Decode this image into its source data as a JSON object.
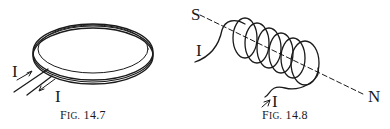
{
  "figures": [
    {
      "id": "fig-14-7",
      "caption_prefix": "F",
      "caption_smallcaps": "IG.",
      "caption_number": "14.7",
      "labels": {
        "current_in": "I",
        "current_out": "I"
      },
      "description": "Flat circular coil of several turns with two leads carrying current I in and out"
    },
    {
      "id": "fig-14-8",
      "caption_prefix": "F",
      "caption_smallcaps": "IG.",
      "caption_number": "14.8",
      "labels": {
        "south": "S",
        "north": "N",
        "current_in": "I",
        "current_out": "I"
      },
      "description": "Solenoid with helical windings along a dashed S–N axis, current I entering and leaving"
    }
  ],
  "colors": {
    "ink": "#1a1a1a",
    "background": "#ffffff"
  }
}
